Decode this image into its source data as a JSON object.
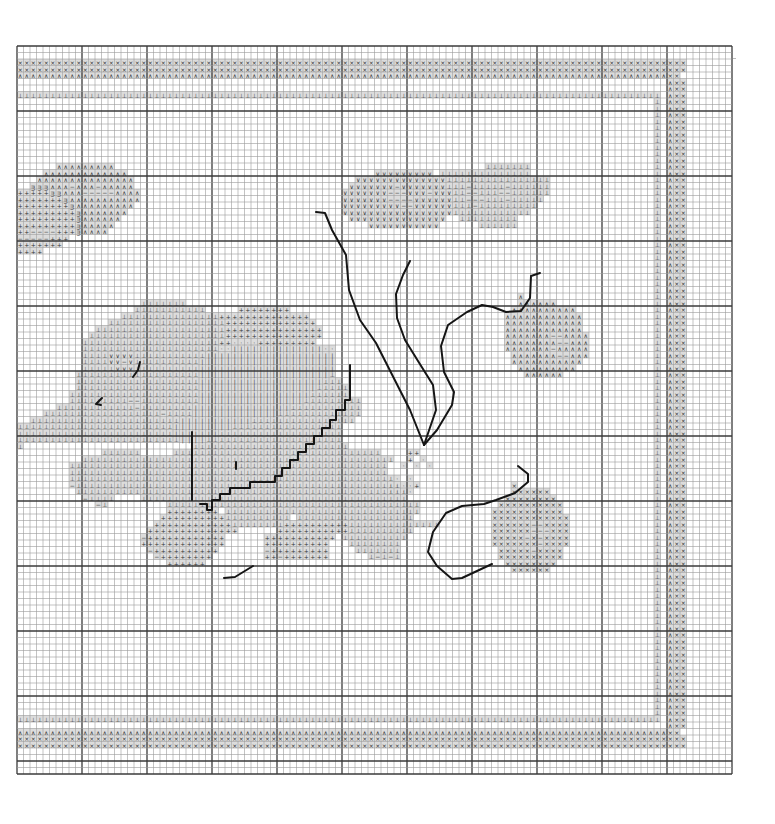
{
  "pattern": {
    "title": "Cross-stitch chart",
    "grid": {
      "origin_x": 17,
      "origin_y": 46,
      "cell": 6.5,
      "cols": 110,
      "rows": 112,
      "heavy_every": 10
    },
    "colors": {
      "background": "#ffffff",
      "thin_line": "#9a9a9a",
      "heavy_line": "#3a3a3a",
      "shade": "#dcdcdc",
      "symbol": "#333333",
      "backstitch": "#151515"
    },
    "legend_symbols": {
      "X": "×",
      "A": "∧",
      "T": "⊥",
      "V": "∨",
      "P": "+",
      "D": "−",
      "B": "ᴟ",
      "I": "|",
      "S": "·"
    },
    "runs": [
      {
        "r": 2,
        "c": 0,
        "s": "XXXXXXXXXXXXXXXXXXXXXXXXXXXXXXXXXXXXXXXXXXXXXXXXXXXXXXXXXXXXXXXXXXXXXXXXXXXXXXXXXXXXXXXXXXXXXXXXXXXXXXX"
      },
      {
        "r": 3,
        "c": 0,
        "s": "XXXXXXXXXXXXXXXXXXXXXXXXXXXXXXXXXXXXXXXXXXXXXXXXXXXXXXXXXXXXXXXXXXXXXXXXXXXXXXXXXXXXXXXXXXXXXXXXXXXXXXX"
      },
      {
        "r": 4,
        "c": 0,
        "s": "AAAAAAAAAAAAAAAAAAAAAAAAAAAAAAAAAAAAAAAAAAAAAAAAAAAAAAAAAAAAAAAAAAAAAAAAAAAAAAAAAAAAAAAAAAAAAAAAAAAAXX"
      },
      {
        "r": 5,
        "c": 100,
        "s": "AXX"
      },
      {
        "r": 6,
        "c": 100,
        "s": "AXX"
      },
      {
        "r": 7,
        "c": 0,
        "s": "TTTTTTTTTTTTTTTTTTTTTTTTTTTTTTTTTTTTTTTTTTTTTTTTTTTTTTTTTTTTTTTTTTTTTTTTTTTTTTTTTTTTTTTTTTTTTTTTTTT_AXX"
      },
      {
        "r": 18,
        "c": 6,
        "s": "AAAAAAAAA"
      },
      {
        "r": 19,
        "c": 4,
        "s": "AAAAAAAAAAAAA"
      },
      {
        "r": 20,
        "c": 3,
        "s": "AAAAAAAAAAAAAAA"
      },
      {
        "r": 21,
        "c": 2,
        "s": "BBBAAADAAADAAAAA"
      },
      {
        "r": 22,
        "c": 0,
        "s": "PPPPPBBAAADDDDDAAAA"
      },
      {
        "r": 23,
        "c": 0,
        "s": "PPPPPPPBAAAAAAAAAAA"
      },
      {
        "r": 24,
        "c": 0,
        "s": "PPPPPPPPBAAAAAAAAA"
      },
      {
        "r": 25,
        "c": 0,
        "s": "PPPPPPPPPBAAAAAAA"
      },
      {
        "r": 26,
        "c": 0,
        "s": "PPPPPPPPPBAAAAAA"
      },
      {
        "r": 27,
        "c": 0,
        "s": "PPPPPPPPPBAAAAA"
      },
      {
        "r": 28,
        "c": 0,
        "s": "PPDDDDPPPBAAAA"
      },
      {
        "r": 29,
        "c": 0,
        "s": "DDDDDPPP"
      },
      {
        "r": 30,
        "c": 0,
        "s": "PPPPPPP"
      },
      {
        "r": 31,
        "c": 0,
        "s": "PPPP"
      },
      {
        "r": 18,
        "c": 72,
        "s": "TTTTTTT"
      },
      {
        "r": 19,
        "c": 55,
        "s": "VVVVVVVVV_TTTTTTTTTTTTTT"
      },
      {
        "r": 20,
        "c": 52,
        "s": "VVVVVVVVVVVVVVTTTTTTTTTTTTTTTT"
      },
      {
        "r": 21,
        "c": 51,
        "s": "VVVVVVVDVVVVVVVTTTDTTTTTDTTTTTT"
      },
      {
        "r": 22,
        "c": 50,
        "s": "VVVVVVVDDDVVVDVVVTTDDTTTDDTTTTTT"
      },
      {
        "r": 23,
        "c": 50,
        "s": "VVVVVVVDDDDVVVVVVTTDDDTTTDTTTTT"
      },
      {
        "r": 24,
        "c": 50,
        "s": "VVVVVVVVVDDVVVVVVTTTDTTTTTTTTT"
      },
      {
        "r": 25,
        "c": 50,
        "s": "VVVVVVVVVVVVVVVVVTTTTTTTTTTTT"
      },
      {
        "r": 26,
        "c": 51,
        "s": "VVVVVVVVVVVVVVV__TTTTTTTTT"
      },
      {
        "r": 27,
        "c": 54,
        "s": "VVVVVVVVVVV______TTTTTT"
      },
      {
        "r": 39,
        "c": 19,
        "s": "TTTTTTT"
      },
      {
        "r": 40,
        "c": 18,
        "s": "TTTTTTTTTTT_____PPPPPPPP"
      },
      {
        "r": 41,
        "c": 16,
        "s": "TTTTTTTTTTTTTTTPPPPPPPPPPPPPP"
      },
      {
        "r": 42,
        "c": 14,
        "s": "TTTTTTTTTTTTTTTTTTPPPPPPPPPPPPPP"
      },
      {
        "r": 43,
        "c": 12,
        "s": "TTTTTTTTTTTTTTTTTTTTPPPPPPPPPPPPPPP"
      },
      {
        "r": 44,
        "c": 11,
        "s": "TTTTTTTTTTTTTTTTTTTTTPPPPPPPPPPPPPPP"
      },
      {
        "r": 45,
        "c": 10,
        "s": "TTTTTTTTTTTTTTTTTTTTTPPSSSSPPPPPPPPP"
      },
      {
        "r": 46,
        "c": 10,
        "s": "TTTTTTTTTTTTTTTTTTTTTSSIIIIIIIIIIIIIISS"
      },
      {
        "r": 47,
        "c": 10,
        "s": "TTTTVVVVTTTTTTTTTTTIIIIIIIIIIIIIIIIIIII"
      },
      {
        "r": 48,
        "c": 10,
        "s": "TTTTVVDVTTTTTTTTTTIIIIIIIIIIIIIIIIIIIII"
      },
      {
        "r": 49,
        "c": 10,
        "s": "TTTTTVVVTTTTTTTTTTIIIIIIIIIIIIIIIIIIIII"
      },
      {
        "r": 50,
        "c": 9,
        "s": "TTTTTTTTTTTTTTTTTTTIIIIIIIIIIIIIIIIIIIIT"
      },
      {
        "r": 51,
        "c": 9,
        "s": "TTTTTTTTTTTTTTTTTTTIIIIIIIIIIIIIIIIIIITTT"
      },
      {
        "r": 52,
        "c": 9,
        "s": "TTTTTTTTTTTTTTTTTTTIIIIIIIIIIIIIIIIIITTTTT"
      },
      {
        "r": 53,
        "c": 8,
        "s": "TTTTTTTTTTTTTTTTTTTTIIIIIIIIIIIIIIIIITTTTTT"
      },
      {
        "r": 54,
        "c": 8,
        "s": "TTTTTTTTTDDTTTTTTTTTIIIIIIIIIIIIIIIITTTTTTTTT"
      },
      {
        "r": 55,
        "c": 6,
        "s": "TTTTTTTTTTTTDTTTTTTTTIIIIIIIIIIIIIIITTTTTTTTTTT"
      },
      {
        "r": 56,
        "c": 4,
        "s": "TTTTTTTTTTTTTTTTTTDTTTTIIIIIIIIIIIIITTTTTTTTTTTTT"
      },
      {
        "r": 57,
        "c": 2,
        "s": "TTTTTTTTTTTTTTTTTTTTTTTIIIIIIIIIIITTTTTTTTTTTTTTTT"
      },
      {
        "r": 58,
        "c": 0,
        "s": "TTTTTTTTTTTTTTTTTTTTTTTTIIIIIIIIITTTTTTTTTTTTTTTTT"
      },
      {
        "r": 59,
        "c": 0,
        "s": "TTTTTTTTTTTTTTTTTTTTTTTTIIIIIIITTTTTTTTTTTTTTTTTTT"
      },
      {
        "r": 60,
        "c": 0,
        "s": "TTTTTTTTTTTTTTTTTTTTTTTTTIIIITTTTTTTTTTTTTTTTTTTTT"
      },
      {
        "r": 61,
        "c": 0,
        "s": "T__________________________TTTTTTTTTTTTTTTTTTTTTTTT"
      },
      {
        "r": 62,
        "c": 13,
        "s": "TTTTTT_____TTTTTTTTTTTTTTTTTTTTTTTTTTTTTTTT"
      },
      {
        "r": 63,
        "c": 10,
        "s": "TTTTTTTTTTTTTTTTTTTTTTTTTTTTTTTTTTTTTTTTTTTTTTTT"
      },
      {
        "r": 64,
        "c": 8,
        "s": "TTTTTTTTTTTTTTTTTTTTTTTTTTTTTTTTTTTTTTTTTTTTTTTTT"
      },
      {
        "r": 65,
        "c": 8,
        "s": "TTTTTTTTTTTTTTTTTTTTTTTTTTTTTTTTTTTTTTTTTTTTTTTTT"
      },
      {
        "r": 66,
        "c": 8,
        "s": "TTTTTTTTTTTTTTTTTTTTTTTTTTTTTTTTTTTTTTTTTTTTTTTTTT"
      },
      {
        "r": 67,
        "c": 8,
        "s": "DTTTTTTTTTTTTTTTTTTTTTTTTTTTTTTTTTTTTTTTTTTTTTTTTTT"
      },
      {
        "r": 68,
        "c": 9,
        "s": "TTTTTTTTTTTTTTTTTTTTTTTTTTTTTTTTTTTTTTTTTTTTTTTTTTT"
      },
      {
        "r": 69,
        "c": 10,
        "s": "DTTTT____TTTTTTTTTTTTTTTTTTTTTTTTTTTTTTTTTTTTTTTTT"
      },
      {
        "r": 70,
        "c": 12,
        "s": "DT_________TTTTTTTTTTTTTTTTTTTTTTTTTTTTTTTTTTTTTTT"
      },
      {
        "r": 71,
        "c": 23,
        "s": "PPPPPPPP_TTTTTTTTTTTTTTTTTTTTTTTTTTTTTT"
      },
      {
        "r": 72,
        "c": 22,
        "s": "PPPPPPPPPPTTTTTTTTTT_TTTTTTTTTTTTTTTTTT"
      },
      {
        "r": 73,
        "c": 21,
        "s": "PPPPPPPPPPPPTTTTTTTTPPPPPPPPPPTTTTTTTTTTTTTT"
      },
      {
        "r": 74,
        "c": 20,
        "s": "PPPPPPPPPPPPPP______PPPPPPPPPPPTTTTTTTTTT"
      },
      {
        "r": 75,
        "c": 19,
        "s": "DPPPPPPPPPPPP______PPPPPPPPPPP_TTTTTTTTTT"
      },
      {
        "r": 76,
        "c": 19,
        "s": "PPPPPPPPPPPPP______PPPPPPPPPP___TTTTTTTT"
      },
      {
        "r": 77,
        "c": 20,
        "s": "DPPPPPPPPPP_______DPPPPPPPPP____TTTTTTT"
      },
      {
        "r": 78,
        "c": 21,
        "s": "DPPPPPPPP________PPDPPPPPPP______TDTDT"
      },
      {
        "r": 79,
        "c": 23,
        "s": "PPPPPP"
      },
      {
        "r": 38,
        "c": 77,
        "s": "A"
      },
      {
        "r": 39,
        "c": 77,
        "s": "AAAAAA"
      },
      {
        "r": 40,
        "c": 76,
        "s": "AAAAAAAAAA"
      },
      {
        "r": 41,
        "c": 75,
        "s": "AAAAAAAAAAAA"
      },
      {
        "r": 42,
        "c": 75,
        "s": "AAAAAAAAAAAA"
      },
      {
        "r": 43,
        "c": 75,
        "s": "AAAAAAAAAAAA"
      },
      {
        "r": 44,
        "c": 75,
        "s": "AAAAAAADDAAAA"
      },
      {
        "r": 45,
        "c": 75,
        "s": "AAAAAAAADDAAA"
      },
      {
        "r": 46,
        "c": 75,
        "s": "AAAAAAADAAAAA"
      },
      {
        "r": 47,
        "c": 76,
        "s": "AAAAAAADDAAA"
      },
      {
        "r": 48,
        "c": 76,
        "s": "AAAAAAAAAAA"
      },
      {
        "r": 49,
        "c": 77,
        "s": "AAAAAAAAA"
      },
      {
        "r": 50,
        "c": 78,
        "s": "AAAAAA"
      },
      {
        "r": 62,
        "c": 60,
        "s": "PP"
      },
      {
        "r": 63,
        "c": 60,
        "s": "P_S"
      },
      {
        "r": 64,
        "c": 59,
        "s": "S_S_S"
      },
      {
        "r": 66,
        "c": 58,
        "s": "S_S"
      },
      {
        "r": 67,
        "c": 57,
        "s": "SSSSP"
      },
      {
        "r": 68,
        "c": 57,
        "s": "SSSS"
      },
      {
        "r": 67,
        "c": 76,
        "s": "X"
      },
      {
        "r": 68,
        "c": 76,
        "s": "XXXXXX"
      },
      {
        "r": 69,
        "c": 75,
        "s": "XXXXXXXX"
      },
      {
        "r": 70,
        "c": 74,
        "s": "XXXXXXXXXX"
      },
      {
        "r": 71,
        "c": 73,
        "s": "XXXXXXXXXXX"
      },
      {
        "r": 72,
        "c": 73,
        "s": "XXXXXXXXXXXX"
      },
      {
        "r": 73,
        "c": 73,
        "s": "XXXXXXDDXXXX"
      },
      {
        "r": 74,
        "c": 73,
        "s": "XXXXXXDDDXXX"
      },
      {
        "r": 75,
        "c": 73,
        "s": "XXXXXDXDXXXX"
      },
      {
        "r": 76,
        "c": 73,
        "s": "XXXXXXXDXXXX"
      },
      {
        "r": 77,
        "c": 74,
        "s": "XXXXXDXXXX"
      },
      {
        "r": 78,
        "c": 74,
        "s": "XXXXXXXXXX"
      },
      {
        "r": 79,
        "c": 75,
        "s": "XXXXXXXX"
      },
      {
        "r": 80,
        "c": 76,
        "s": "XXXXXX"
      },
      {
        "r": 103,
        "c": 0,
        "s": "TTTTTTTTTTTTTTTTTTTTTTTTTTTTTTTTTTTTTTTTTTTTTTTTTTTTTTTTTTTTTTTTTTTTTTTTTTTTTTTTTTTTTTTTTTTTTTTTTTT_AXX"
      },
      {
        "r": 104,
        "c": 100,
        "s": "AXX"
      },
      {
        "r": 105,
        "c": 0,
        "s": "AAAAAAAAAAAAAAAAAAAAAAAAAAAAAAAAAAAAAAAAAAAAAAAAAAAAAAAAAAAAAAAAAAAAAAAAAAAAAAAAAAAAAAAAAAAAAAAAAAAAXX"
      },
      {
        "r": 106,
        "c": 0,
        "s": "XXXXXXXXXXXXXXXXXXXXXXXXXXXXXXXXXXXXXXXXXXXXXXXXXXXXXXXXXXXXXXXXXXXXXXXXXXXXXXXXXXXXXXXXXXXXXXXXXXXXXXX"
      },
      {
        "r": 107,
        "c": 0,
        "s": "XXXXXXXXXXXXXXXXXXXXXXXXXXXXXXXXXXXXXXXXXXXXXXXXXXXXXXXXXXXXXXXXXXXXXXXXXXXXXXXXXXXXXXXXXXXXXXXXXXXXXXX"
      }
    ],
    "side_band": {
      "rows_from": 8,
      "rows_to": 102,
      "t_col": 98,
      "t_rows_from": 8,
      "t_rows_to": 102,
      "cols": [
        "A",
        "X",
        "X"
      ],
      "col_start": 100
    },
    "backstitch_paths": [
      "M316,212 L325,213 L332,230 L346,255 L349,290 L360,320 L376,343 L410,410 L424,445",
      "M410,261 L403,275 L396,294 L397,318 L405,340 L418,361 L433,385 L436,410 L424,445",
      "M424,445 L437,430 L452,405 L454,392 L444,372 L441,346 L448,325 L467,312 L482,305 L493,307 L506,312 L521,311 L530,298 L531,276 L540,273",
      "M350,365 L350,400 L345,400 L345,410 L336,410 L336,420 L330,420 L330,428 L322,428 L322,436 L314,436 L314,444 L306,444 L306,452 L298,452 L298,460 L290,460 L290,468 L282,468 L282,476 L275,476 L275,482 L250,482 L250,488 L230,488 L230,494 L220,494 L220,500 L212,500 L212,510 L207,510 L207,504 L200,504",
      "M192,432 L192,500",
      "M518,466 L528,474 L528,482 L515,493 L496,500 L484,504 L462,506 L446,513 L433,532 L428,552 L437,566 L452,579 L462,578 L492,564",
      "M140,362 L138,370 L133,377",
      "M102,398 L96,404 L101,405",
      "M224,578 L235,577 L253,566",
      "M236,462 L236,469"
    ]
  }
}
